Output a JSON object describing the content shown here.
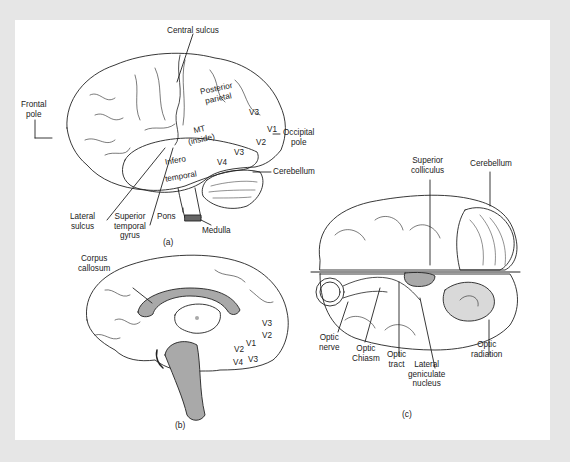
{
  "figure": {
    "panels": [
      {
        "id": "a",
        "caption": "(a)",
        "view": "lateral",
        "labels": {
          "central_sulcus": "Central sulcus",
          "frontal_pole_1": "Frontal",
          "frontal_pole_2": "pole",
          "posterior_parietal_1": "Posterior",
          "posterior_parietal_2": "parietal",
          "mt_1": "MT",
          "mt_2": "(inside)",
          "v3_top": "V3",
          "v1": "V1",
          "v2": "V2",
          "v3_low": "V3",
          "v4": "V4",
          "occipital_pole_1": "Occipital",
          "occipital_pole_2": "pole",
          "infero": "Infero",
          "temporal": "temporal",
          "cerebellum": "Cerebellum",
          "lateral_sulcus_1": "Lateral",
          "lateral_sulcus_2": "sulcus",
          "sup_temporal_1": "Superior",
          "sup_temporal_2": "temporal",
          "sup_temporal_3": "gyrus",
          "pons": "Pons",
          "medulla": "Medulla"
        }
      },
      {
        "id": "b",
        "caption": "(b)",
        "view": "medial",
        "labels": {
          "corpus_1": "Corpus",
          "corpus_2": "callosum",
          "v3a": "V3",
          "v2a": "V2",
          "v1": "V1",
          "v2b": "V2",
          "v4": "V4",
          "v3b": "V3"
        }
      },
      {
        "id": "c",
        "caption": "(c)",
        "view": "ventral / dissected",
        "labels": {
          "sup_coll_1": "Superior",
          "sup_coll_2": "colliculus",
          "cerebellum": "Cerebellum",
          "optic_nerve_1": "Optic",
          "optic_nerve_2": "nerve",
          "optic_chiasm_1": "Optic",
          "optic_chiasm_2": "Chiasm",
          "optic_tract_1": "Optic",
          "optic_tract_2": "tract",
          "lgn_1": "Lateral",
          "lgn_2": "geniculate",
          "lgn_3": "nucleus",
          "optic_rad_1": "Optic",
          "optic_rad_2": "radiation"
        }
      }
    ],
    "colors": {
      "background": "#e6e6e6",
      "panel": "#ffffff",
      "ink": "#222222",
      "shaded": "#a9a9a9"
    }
  }
}
